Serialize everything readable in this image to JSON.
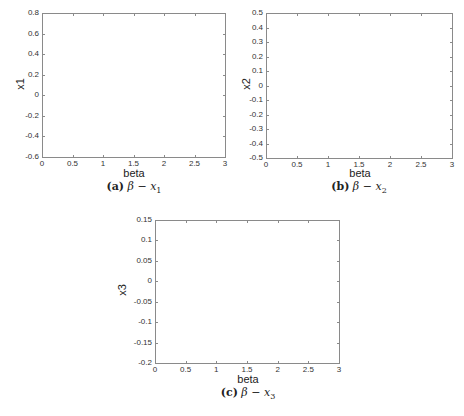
{
  "chart_data": [
    {
      "type": "scatter",
      "id": "a",
      "title": "",
      "caption": {
        "label": "(a)",
        "expr": "β − x",
        "sub": "1"
      },
      "xlabel": "beta",
      "ylabel": "x1",
      "xlim": [
        0,
        3
      ],
      "ylim": [
        -0.6,
        0.8
      ],
      "xticks": [
        "0",
        "0.5",
        "1",
        "1.5",
        "2",
        "2.5",
        "3"
      ],
      "yticks": [
        "0.8",
        "0.6",
        "0.4",
        "0.2",
        "0",
        "-0.2",
        "-0.4",
        "-0.6"
      ],
      "grid": false,
      "series": []
    },
    {
      "type": "scatter",
      "id": "b",
      "title": "",
      "caption": {
        "label": "(b)",
        "expr": "β − x",
        "sub": "2"
      },
      "xlabel": "beta",
      "ylabel": "x2",
      "xlim": [
        0,
        3
      ],
      "ylim": [
        -0.5,
        0.5
      ],
      "xticks": [
        "0",
        "0.5",
        "1",
        "1.5",
        "2",
        "2.5",
        "3"
      ],
      "yticks": [
        "0.5",
        "0.4",
        "0.3",
        "0.2",
        "0.1",
        "0",
        "-0.1",
        "-0.2",
        "-0.3",
        "-0.4",
        "-0.5"
      ],
      "grid": false,
      "series": []
    },
    {
      "type": "scatter",
      "id": "c",
      "title": "",
      "caption": {
        "label": "(c)",
        "expr": "β − x",
        "sub": "3"
      },
      "xlabel": "beta",
      "ylabel": "x3",
      "xlim": [
        0,
        3
      ],
      "ylim": [
        -0.2,
        0.15
      ],
      "xticks": [
        "0",
        "0.5",
        "1",
        "1.5",
        "2",
        "2.5",
        "3"
      ],
      "yticks": [
        "0.15",
        "0.1",
        "0.05",
        "0",
        "-0.05",
        "-0.1",
        "-0.15",
        "-0.2"
      ],
      "grid": false,
      "series": []
    }
  ]
}
